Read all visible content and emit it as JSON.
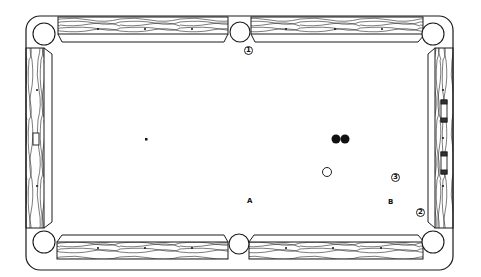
{
  "diagram": {
    "table": {
      "rail_color": "#ffffff",
      "line_color": "#1a1a1a",
      "felt_color": "#ffffff"
    },
    "labels": {
      "pocket_1": "1",
      "pocket_2": "2",
      "position_3": "3",
      "point_a": "A",
      "point_b": "B"
    },
    "balls": [
      {
        "name": "object-ball-1",
        "color": "black",
        "x": 336,
        "y": 139
      },
      {
        "name": "object-ball-2",
        "color": "black",
        "x": 345,
        "y": 139
      },
      {
        "name": "cue-ball",
        "color": "white",
        "x": 327,
        "y": 172
      }
    ],
    "spots": [
      {
        "name": "head-spot",
        "x": 146,
        "y": 139
      }
    ],
    "pockets": [
      {
        "name": "top-left-corner-pocket",
        "x": 44,
        "y": 34
      },
      {
        "name": "top-side-pocket",
        "x": 240,
        "y": 33
      },
      {
        "name": "top-right-corner-pocket",
        "x": 430,
        "y": 34
      },
      {
        "name": "bottom-left-corner-pocket",
        "x": 44,
        "y": 242
      },
      {
        "name": "bottom-side-pocket",
        "x": 240,
        "y": 245
      },
      {
        "name": "bottom-right-corner-pocket",
        "x": 430,
        "y": 242
      }
    ]
  }
}
